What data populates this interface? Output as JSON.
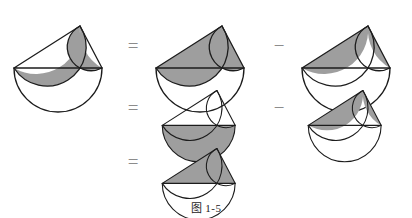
{
  "caption": "图 1-5",
  "colors": {
    "background": "#ffffff",
    "stroke": "#1c1c1c",
    "fill_gray": "#9e9e9e",
    "operator": "#8c8c8c"
  },
  "operators": {
    "equals": "=",
    "minus": "−"
  },
  "geometry": {
    "A": [
      10,
      62
    ],
    "B": [
      98,
      62
    ],
    "C": [
      76,
      20
    ],
    "note": "right triangle, right angle at apex C; semicircles drawn outward on AB, AC, CB"
  },
  "rows": [
    {
      "id": "row-1",
      "left_operator": null,
      "figures": [
        {
          "id": "fig-lunes",
          "name": "two-lunes",
          "shaded": [
            "lune-left",
            "lune-right"
          ],
          "arcs": [
            "semicircle-AB",
            "semicircle-AC",
            "semicircle-CB"
          ],
          "triangle_visible": true,
          "triangle_filled": false
        }
      ]
    },
    {
      "id": "row-1-rhs",
      "left_operator": "=",
      "figures": [
        {
          "id": "fig-leg-semicircles",
          "name": "leg-semicircles-shaded",
          "shaded": [
            "semicircle-AC-disc",
            "semicircle-CB-disc"
          ],
          "arcs": [
            "semicircle-AB",
            "semicircle-AC",
            "semicircle-CB"
          ],
          "triangle_visible": true,
          "triangle_filled": false
        },
        {
          "id": "fig-segments-1",
          "name": "two-segments-shaded",
          "operator_before": "−",
          "shaded": [
            "segment-AC",
            "segment-CB"
          ],
          "arcs": [
            "semicircle-AB",
            "semicircle-AC",
            "semicircle-CB"
          ],
          "triangle_visible": true,
          "triangle_filled": false
        }
      ]
    },
    {
      "id": "row-2",
      "left_operator": "=",
      "figures": [
        {
          "id": "fig-big-semicircle",
          "name": "hypotenuse-semicircle-shaded",
          "shaded": [
            "semicircle-AB-disc"
          ],
          "arcs": [
            "semicircle-AB",
            "semicircle-AC",
            "semicircle-CB"
          ],
          "triangle_visible": true,
          "triangle_filled": false
        },
        {
          "id": "fig-segments-2",
          "name": "two-segments-shaded",
          "operator_before": "−",
          "shaded": [
            "segment-AC",
            "segment-CB"
          ],
          "arcs": [
            "semicircle-AB",
            "semicircle-AC",
            "semicircle-CB"
          ],
          "triangle_visible": true,
          "triangle_filled": false
        }
      ]
    },
    {
      "id": "row-3",
      "left_operator": "=",
      "figures": [
        {
          "id": "fig-triangle",
          "name": "right-triangle-shaded",
          "shaded": [
            "triangle-ABC"
          ],
          "arcs": [
            "semicircle-AB",
            "semicircle-AC",
            "semicircle-CB"
          ],
          "triangle_visible": true,
          "triangle_filled": true
        }
      ]
    }
  ]
}
